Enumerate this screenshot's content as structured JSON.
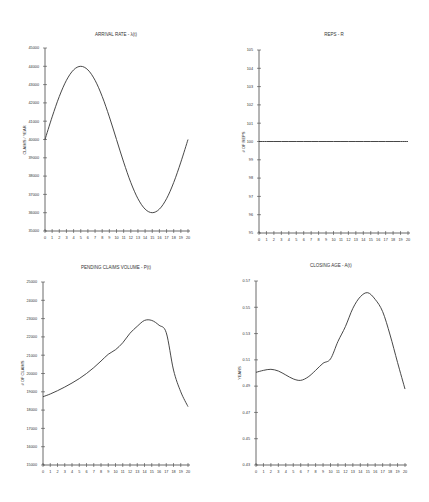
{
  "figure": {
    "panels": [
      {
        "id": "arrival",
        "title": "ARRIVAL RATE - λ(t)",
        "ylabel": "CLAIMS / YEAR"
      },
      {
        "id": "reps",
        "title": "REPS - R",
        "ylabel": "# OF REPS"
      },
      {
        "id": "pending",
        "title": "PENDING CLAIMS VOLUME - P(t)",
        "ylabel": "# OF CLAIMS"
      },
      {
        "id": "closing",
        "title": "CLOSING AGE - A(t)",
        "ylabel": "YEARS"
      }
    ]
  },
  "chart_data": [
    {
      "type": "line",
      "title": "ARRIVAL RATE - λ(t)",
      "xlabel": "",
      "ylabel": "CLAIMS / YEAR",
      "xlim": [
        0,
        20
      ],
      "ylim": [
        35000,
        45000
      ],
      "xticks": [
        0,
        1,
        2,
        3,
        4,
        5,
        6,
        7,
        8,
        9,
        10,
        11,
        12,
        13,
        14,
        15,
        16,
        17,
        18,
        19,
        20
      ],
      "yticks": [
        35000,
        36000,
        37000,
        38000,
        39000,
        40000,
        41000,
        42000,
        43000,
        44000,
        45000
      ],
      "grid": false,
      "x": [
        0,
        1,
        2,
        3,
        4,
        5,
        6,
        7,
        8,
        9,
        10,
        11,
        12,
        13,
        14,
        15,
        16,
        17,
        18,
        19,
        20
      ],
      "values": [
        40000,
        41236,
        42351,
        43236,
        43804,
        44000,
        43804,
        43236,
        42351,
        41236,
        40000,
        38764,
        37649,
        36764,
        36196,
        36000,
        36196,
        36764,
        37649,
        38764,
        40000
      ],
      "box": {
        "x0": 45,
        "x1": 188,
        "y0": 48,
        "y1": 231
      }
    },
    {
      "type": "line",
      "title": "REPS - R",
      "xlabel": "",
      "ylabel": "# OF REPS",
      "xlim": [
        0,
        20
      ],
      "ylim": [
        95,
        105
      ],
      "xticks": [
        0,
        1,
        2,
        3,
        4,
        5,
        6,
        7,
        8,
        9,
        10,
        11,
        12,
        13,
        14,
        15,
        16,
        17,
        18,
        19,
        20
      ],
      "yticks": [
        95,
        96,
        97,
        98,
        99,
        100,
        101,
        102,
        103,
        104,
        105
      ],
      "grid": false,
      "x": [
        0,
        1,
        2,
        3,
        4,
        5,
        6,
        7,
        8,
        9,
        10,
        11,
        12,
        13,
        14,
        15,
        16,
        17,
        18,
        19,
        20
      ],
      "values": [
        100,
        100,
        100,
        100,
        100,
        100,
        100,
        100,
        100,
        100,
        100,
        100,
        100,
        100,
        100,
        100,
        100,
        100,
        100,
        100,
        100
      ],
      "box": {
        "x0": 259,
        "x1": 408,
        "y0": 50,
        "y1": 233
      }
    },
    {
      "type": "line",
      "title": "PENDING CLAIMS VOLUME - P(t)",
      "xlabel": "",
      "ylabel": "# OF CLAIMS",
      "xlim": [
        0,
        20
      ],
      "ylim": [
        15000,
        25000
      ],
      "xticks": [
        0,
        1,
        2,
        3,
        4,
        5,
        6,
        7,
        8,
        9,
        10,
        11,
        12,
        13,
        14,
        15,
        16,
        17,
        18,
        19,
        20
      ],
      "yticks": [
        15000,
        16000,
        17000,
        18000,
        19000,
        20000,
        21000,
        22000,
        23000,
        24000,
        25000
      ],
      "grid": false,
      "x": [
        0,
        1,
        2,
        3,
        4,
        5,
        6,
        7,
        8,
        9,
        10,
        11,
        12,
        13,
        14,
        15,
        16,
        17,
        18,
        19,
        20
      ],
      "values": [
        18730,
        18880,
        19060,
        19260,
        19480,
        19720,
        20000,
        20320,
        20680,
        21050,
        21300,
        21680,
        22200,
        22580,
        22900,
        22900,
        22640,
        22230,
        20190,
        19000,
        18190
      ],
      "box": {
        "x0": 43,
        "x1": 188,
        "y0": 282,
        "y1": 465
      }
    },
    {
      "type": "line",
      "title": "CLOSING AGE - A(t)",
      "xlabel": "",
      "ylabel": "YEARS",
      "xlim": [
        0,
        20
      ],
      "ylim": [
        0.43,
        0.57
      ],
      "xticks": [
        0,
        1,
        2,
        3,
        4,
        5,
        6,
        7,
        8,
        9,
        10,
        11,
        12,
        13,
        14,
        15,
        16,
        17,
        18,
        19,
        20
      ],
      "yticks": [
        0.43,
        0.45,
        0.47,
        0.49,
        0.51,
        0.53,
        0.55,
        0.57
      ],
      "grid": false,
      "x": [
        0,
        1,
        2,
        3,
        4,
        5,
        6,
        7,
        8,
        9,
        10,
        11,
        12,
        13,
        14,
        15,
        16,
        17,
        18,
        19,
        20
      ],
      "values": [
        0.5005,
        0.502,
        0.5028,
        0.5015,
        0.4985,
        0.4955,
        0.4944,
        0.497,
        0.502,
        0.5074,
        0.5107,
        0.524,
        0.5353,
        0.5492,
        0.558,
        0.5611,
        0.556,
        0.5467,
        0.5289,
        0.508,
        0.4878
      ],
      "box": {
        "x0": 256,
        "x1": 405,
        "y0": 281,
        "y1": 465
      }
    }
  ]
}
